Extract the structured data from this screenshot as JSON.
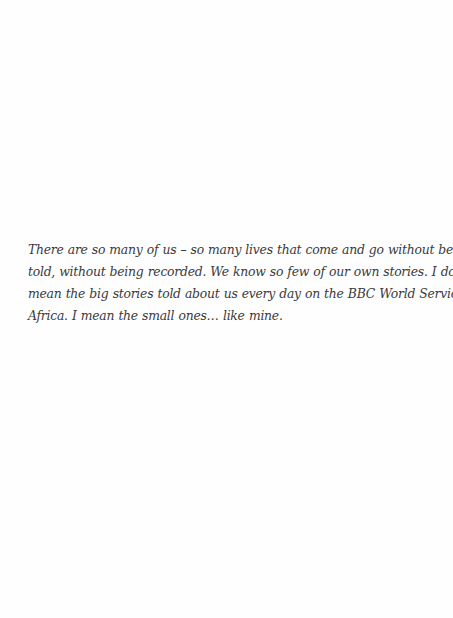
{
  "page": {
    "background": "#ffffff",
    "text_color": "#3a3a3a"
  },
  "passage": {
    "lines": [
      "There are so many of us – so many lives that come and go without being",
      "told, without being recorded. We know so few of our own stories. I don’t",
      "mean the big stories told about us every day on the BBC World Service for",
      "Africa. I mean the small ones… like mine."
    ]
  }
}
